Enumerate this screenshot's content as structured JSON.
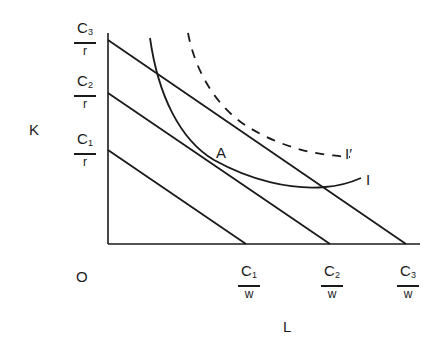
{
  "diagram": {
    "axes": {
      "y_label": "K",
      "x_label": "L",
      "origin_label": "O"
    },
    "y_intercepts": [
      {
        "num": "C",
        "sub": "3",
        "den": "r"
      },
      {
        "num": "C",
        "sub": "2",
        "den": "r"
      },
      {
        "num": "C",
        "sub": "1",
        "den": "r"
      }
    ],
    "x_intercepts": [
      {
        "num": "C",
        "sub": "1",
        "den": "w"
      },
      {
        "num": "C",
        "sub": "2",
        "den": "w"
      },
      {
        "num": "C",
        "sub": "3",
        "den": "w"
      }
    ],
    "curves": {
      "isoquant_solid": "I",
      "isoquant_dashed": "I′"
    },
    "point_label": "A",
    "colors": {
      "ink": "#1a1a1a",
      "background": "#ffffff"
    }
  }
}
